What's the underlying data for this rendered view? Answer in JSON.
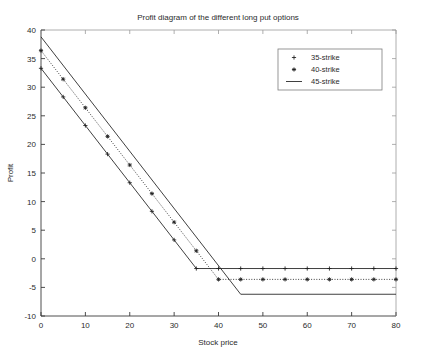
{
  "chart_data": {
    "type": "line",
    "title": "Profit diagram of the different long put options",
    "xlabel": "Stock price",
    "ylabel": "Profit",
    "xlim": [
      0,
      80
    ],
    "ylim": [
      -10,
      40
    ],
    "xticks": [
      0,
      10,
      20,
      30,
      40,
      50,
      60,
      70,
      80
    ],
    "yticks": [
      -10,
      -5,
      0,
      5,
      10,
      15,
      20,
      25,
      30,
      35,
      40
    ],
    "grid": false,
    "legend_position": "upper right",
    "x": [
      0,
      5,
      10,
      15,
      20,
      25,
      30,
      35,
      40,
      45,
      50,
      55,
      60,
      65,
      70,
      75,
      80
    ],
    "series": [
      {
        "name": "35-strike",
        "marker": "plus",
        "linestyle": "solid",
        "strike": 35,
        "premium": 1.7,
        "values": [
          33.3,
          28.3,
          23.3,
          18.3,
          13.3,
          8.3,
          3.3,
          -1.7,
          -1.7,
          -1.7,
          -1.7,
          -1.7,
          -1.7,
          -1.7,
          -1.7,
          -1.7,
          -1.7
        ]
      },
      {
        "name": "40-strike",
        "marker": "star",
        "linestyle": "dotted",
        "strike": 40,
        "premium": 3.6,
        "values": [
          36.4,
          31.4,
          26.4,
          21.4,
          16.4,
          11.4,
          6.4,
          1.4,
          -3.6,
          -3.6,
          -3.6,
          -3.6,
          -3.6,
          -3.6,
          -3.6,
          -3.6,
          -3.6
        ]
      },
      {
        "name": "45-strike",
        "marker": "none",
        "linestyle": "solid",
        "strike": 45,
        "premium": 6.2,
        "values": [
          38.8,
          33.8,
          28.8,
          23.8,
          18.8,
          13.8,
          8.8,
          3.8,
          -1.2,
          -6.2,
          -6.2,
          -6.2,
          -6.2,
          -6.2,
          -6.2,
          -6.2,
          -6.2
        ]
      }
    ]
  },
  "legend": {
    "entries": [
      {
        "label": "35-strike",
        "marker": "+"
      },
      {
        "label": "40-strike",
        "marker": "*"
      },
      {
        "label": "45-strike",
        "marker": "—"
      }
    ]
  },
  "axis": {
    "x_tick_labels": [
      "0",
      "10",
      "20",
      "30",
      "40",
      "50",
      "60",
      "70",
      "80"
    ],
    "y_tick_labels": [
      "-10",
      "-5",
      "0",
      "5",
      "10",
      "15",
      "20",
      "25",
      "30",
      "35",
      "40"
    ]
  }
}
